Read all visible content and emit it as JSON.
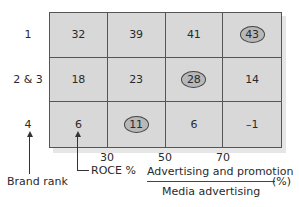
{
  "chart_data": {
    "type": "table",
    "title": "",
    "row_axis_label": "Brand rank",
    "column_axis_label": "Advertising and promotion / Media advertising (%)",
    "value_label": "ROCE %",
    "rows": [
      "1",
      "2 & 3",
      "4"
    ],
    "column_ticks": [
      "30",
      "50",
      "70"
    ],
    "values": [
      [
        32,
        39,
        41,
        43
      ],
      [
        18,
        23,
        28,
        14
      ],
      [
        6,
        11,
        6,
        -1
      ]
    ],
    "highlighted": [
      [
        0,
        3
      ],
      [
        1,
        2
      ],
      [
        2,
        1
      ]
    ]
  },
  "rows": [
    {
      "label": "1",
      "cells": [
        {
          "v": "32",
          "hl": false
        },
        {
          "v": "39",
          "hl": false
        },
        {
          "v": "41",
          "hl": false
        },
        {
          "v": "43",
          "hl": true
        }
      ]
    },
    {
      "label": "2 & 3",
      "cells": [
        {
          "v": "18",
          "hl": false
        },
        {
          "v": "23",
          "hl": false
        },
        {
          "v": "28",
          "hl": true
        },
        {
          "v": "14",
          "hl": false
        }
      ]
    },
    {
      "label": "4",
      "cells": [
        {
          "v": "6",
          "hl": false
        },
        {
          "v": "11",
          "hl": true
        },
        {
          "v": "6",
          "hl": false
        },
        {
          "v": "–1",
          "hl": false
        }
      ]
    }
  ],
  "ticks": [
    "30",
    "50",
    "70"
  ],
  "labels": {
    "brand_rank": "Brand rank",
    "roce": "ROCE %",
    "numerator": "Advertising and promotion",
    "denominator": "Media advertising",
    "unit": "(%)"
  }
}
